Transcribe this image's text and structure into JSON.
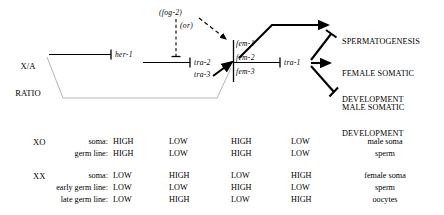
{
  "diagram": {
    "input_node": {
      "line1": "X/A",
      "line2": "RATIO"
    },
    "genes": {
      "her1": "her-1",
      "tra2": "tra-2",
      "tra3": "tra-3",
      "fem1": "fem-1",
      "fem2": "fem-2",
      "fem3": "fem-3",
      "tra1": "tra-1",
      "fog2": "(fog-2)",
      "or": "(or)"
    },
    "outcomes": [
      {
        "id": "spermatogenesis",
        "line1": "SPERMATOGENESIS",
        "line2": ""
      },
      {
        "id": "female-somatic-development",
        "line1": "FEMALE SOMATIC",
        "line2": "DEVELOPMENT"
      },
      {
        "id": "male-somatic-development",
        "line1": "MALE SOMATIC",
        "line2": "DEVELOPMENT"
      }
    ],
    "colors": {
      "line": "#000000",
      "gray_line": "#b4b4b4",
      "text": "#000000"
    }
  },
  "table": {
    "groups": [
      {
        "genotype": "XO",
        "rows": [
          {
            "label": "soma:",
            "values": [
              "HIGH",
              "LOW",
              "HIGH",
              "LOW"
            ],
            "result": "male soma"
          },
          {
            "label": "germ line:",
            "values": [
              "HIGH",
              "LOW",
              "HIGH",
              "LOW"
            ],
            "result": "sperm"
          }
        ]
      },
      {
        "genotype": "XX",
        "rows": [
          {
            "label": "soma:",
            "values": [
              "LOW",
              "HIGH",
              "LOW",
              "HIGH"
            ],
            "result": "female soma"
          },
          {
            "label": "early germ line:",
            "values": [
              "LOW",
              "LOW",
              "HIGH",
              "LOW"
            ],
            "result": "sperm"
          },
          {
            "label": "late germ line:",
            "values": [
              "LOW",
              "HIGH",
              "LOW",
              "HIGH"
            ],
            "result": "oocytes"
          }
        ]
      }
    ]
  }
}
